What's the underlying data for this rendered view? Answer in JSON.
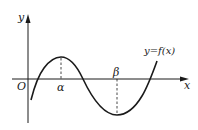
{
  "figure": {
    "axes": {
      "x_label": "x",
      "y_label": "y",
      "origin_label": "O"
    },
    "curve_label": "y=f(x)",
    "points": {
      "alpha_label": "α",
      "beta_label": "β"
    },
    "colors": {
      "stroke": "#1a1a1a",
      "background": "#ffffff"
    }
  }
}
